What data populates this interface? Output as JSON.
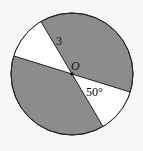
{
  "diagram": {
    "type": "circle-sectors",
    "center_label": "O",
    "radius_label": "3",
    "angle_label": "50°",
    "colors": {
      "shaded": "#8c8c8c",
      "unshaded": "#ffffff",
      "stroke": "#222222",
      "background": "#f7f7f5"
    }
  }
}
